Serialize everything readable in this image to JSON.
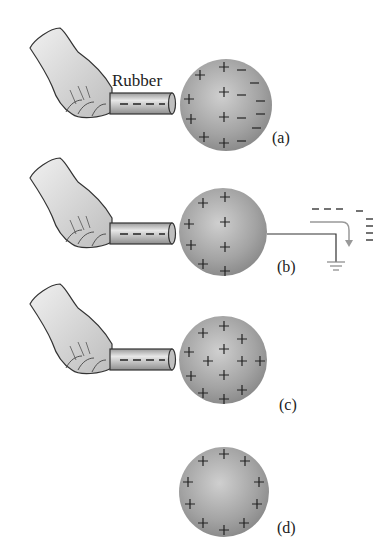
{
  "figure": {
    "rod_label": "Rubber",
    "panels": [
      {
        "id": "a",
        "label": "(a)",
        "description": "Negatively charged rubber rod near neutral sphere; charges polarize: + near rod, - on far side"
      },
      {
        "id": "b",
        "label": "(b)",
        "description": "Sphere grounded by wire; electrons flow to ground"
      },
      {
        "id": "c",
        "label": "(c)",
        "description": "Ground removed; sphere retains positive charges near rod"
      },
      {
        "id": "d",
        "label": "(d)",
        "description": "Rod removed; positive charge distributed uniformly on sphere surface"
      }
    ],
    "colors": {
      "sphere": "#9a9a9a",
      "sphere_highlight": "#cfcfcf",
      "ink": "#222222",
      "ground_arrow": "#8a8a8a"
    }
  }
}
